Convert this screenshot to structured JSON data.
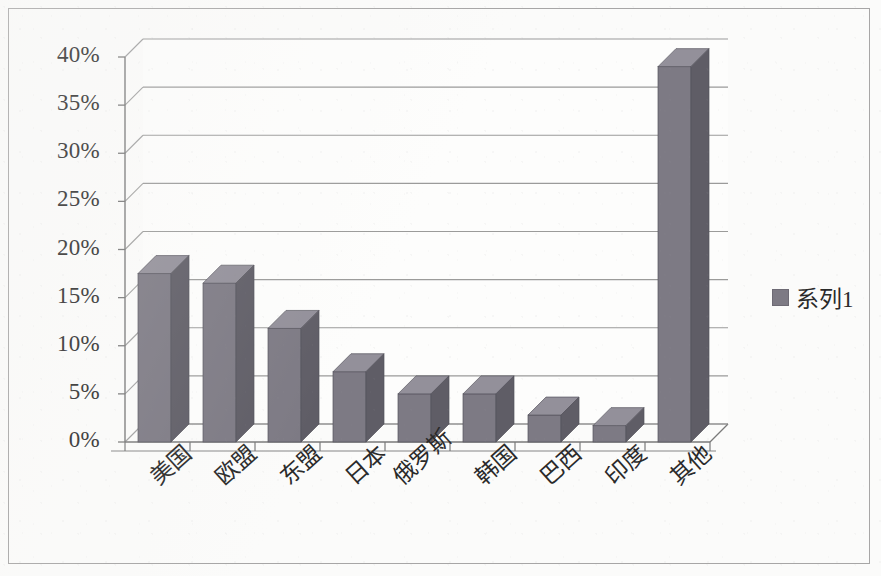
{
  "chart_data": {
    "type": "bar",
    "title": "",
    "subtitle": "",
    "xlabel": "",
    "ylabel": "",
    "categories": [
      "美国",
      "欧盟",
      "东盟",
      "日本",
      "俄罗斯",
      "韩国",
      "巴西",
      "印度",
      "其他"
    ],
    "values": [
      17.5,
      16.5,
      11.8,
      7.3,
      5.0,
      5.0,
      2.8,
      1.7,
      39.0
    ],
    "value_unit": "%",
    "series": [
      {
        "name": "系列1",
        "values": [
          17.5,
          16.5,
          11.8,
          7.3,
          5.0,
          5.0,
          2.8,
          1.7,
          39.0
        ]
      }
    ],
    "ylim": [
      0,
      40
    ],
    "ytick_values": [
      0,
      5,
      10,
      15,
      20,
      25,
      30,
      35,
      40
    ],
    "ytick_labels": [
      "0%",
      "5%",
      "10%",
      "15%",
      "20%",
      "25%",
      "30%",
      "35%",
      "40%"
    ],
    "grid": true,
    "grid_axis": "y",
    "legend_position": "right",
    "three_d": true,
    "bar_color": "#7d7a84",
    "bar_top_color": "#93909a",
    "bar_side_color": "#5f5d66",
    "grid_color": "#8a8a8a",
    "axis_color": "#7a7a7a",
    "background_color": "#fbfbfa"
  },
  "legend": {
    "series_label": "系列1",
    "swatch_color": "#7d7a84"
  },
  "figure": {
    "border_color": "#a7a6a6"
  }
}
